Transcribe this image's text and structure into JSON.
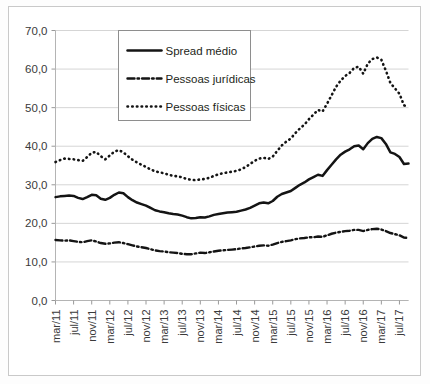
{
  "chart_data": {
    "type": "line",
    "title": "",
    "subtitle": "",
    "xlabel": "",
    "ylabel": "",
    "ylim": [
      0,
      70
    ],
    "ytick_labels": [
      "0,0",
      "10,0",
      "20,0",
      "30,0",
      "40,0",
      "50,0",
      "60,0",
      "70,0"
    ],
    "ytick_values": [
      0,
      10,
      20,
      30,
      40,
      50,
      60,
      70
    ],
    "grid": true,
    "legend_position": "top-center-left",
    "decimal_separator": ",",
    "x_tick_labels": [
      "mar/11",
      "jul/11",
      "nov/11",
      "mar/12",
      "jul/12",
      "nov/12",
      "mar/13",
      "jul/13",
      "nov/13",
      "mar/14",
      "jul/14",
      "nov/14",
      "mar/15",
      "jul/15",
      "nov/15",
      "mar/16",
      "jul/16",
      "nov/16",
      "mar/17",
      "jul/17"
    ],
    "x_tick_step_months": 4,
    "x_start": "mar/11",
    "x_end": "set/17",
    "x_months": [
      "mar/11",
      "abr/11",
      "mai/11",
      "jun/11",
      "jul/11",
      "ago/11",
      "set/11",
      "out/11",
      "nov/11",
      "dez/11",
      "jan/12",
      "fev/12",
      "mar/12",
      "abr/12",
      "mai/12",
      "jun/12",
      "jul/12",
      "ago/12",
      "set/12",
      "out/12",
      "nov/12",
      "dez/12",
      "jan/13",
      "fev/13",
      "mar/13",
      "abr/13",
      "mai/13",
      "jun/13",
      "jul/13",
      "ago/13",
      "set/13",
      "out/13",
      "nov/13",
      "dez/13",
      "jan/14",
      "fev/14",
      "mar/14",
      "abr/14",
      "mai/14",
      "jun/14",
      "jul/14",
      "ago/14",
      "set/14",
      "out/14",
      "nov/14",
      "dez/14",
      "jan/15",
      "fev/15",
      "mar/15",
      "abr/15",
      "mai/15",
      "jun/15",
      "jul/15",
      "ago/15",
      "set/15",
      "out/15",
      "nov/15",
      "dez/15",
      "jan/16",
      "fev/16",
      "mar/16",
      "abr/16",
      "mai/16",
      "jun/16",
      "jul/16",
      "ago/16",
      "set/16",
      "out/16",
      "nov/16",
      "dez/16",
      "jan/17",
      "fev/17",
      "mar/17",
      "abr/17",
      "mai/17",
      "jun/17",
      "jul/17",
      "ago/17",
      "set/17"
    ],
    "series": [
      {
        "name": "Spread médio",
        "style": "solid",
        "color": "#141414",
        "values": [
          26.8,
          27.0,
          27.1,
          27.2,
          27.1,
          26.6,
          26.3,
          26.8,
          27.4,
          27.3,
          26.4,
          26.1,
          26.6,
          27.4,
          28.0,
          27.8,
          26.8,
          26.0,
          25.4,
          25.0,
          24.6,
          24.0,
          23.4,
          23.1,
          22.9,
          22.6,
          22.4,
          22.3,
          22.0,
          21.6,
          21.3,
          21.4,
          21.6,
          21.5,
          21.8,
          22.2,
          22.4,
          22.6,
          22.8,
          22.9,
          23.0,
          23.3,
          23.6,
          24.0,
          24.6,
          25.2,
          25.4,
          25.2,
          25.8,
          26.9,
          27.6,
          28.0,
          28.4,
          29.2,
          30.0,
          30.6,
          31.4,
          32.0,
          32.6,
          32.3,
          33.8,
          35.2,
          36.6,
          37.8,
          38.6,
          39.2,
          40.0,
          40.2,
          39.2,
          40.8,
          41.9,
          42.4,
          42.1,
          40.6,
          38.4,
          38.0,
          37.2,
          35.4,
          35.5
        ]
      },
      {
        "name": "Pessoas jurídicas",
        "style": "dash-dot",
        "color": "#141414",
        "values": [
          15.7,
          15.6,
          15.5,
          15.6,
          15.4,
          15.2,
          15.1,
          15.4,
          15.6,
          15.3,
          14.9,
          14.7,
          14.8,
          15.0,
          15.1,
          14.9,
          14.6,
          14.3,
          14.0,
          13.8,
          13.6,
          13.3,
          13.0,
          12.8,
          12.7,
          12.5,
          12.4,
          12.3,
          12.1,
          12.0,
          12.0,
          12.2,
          12.4,
          12.3,
          12.5,
          12.7,
          12.9,
          13.0,
          13.1,
          13.2,
          13.3,
          13.5,
          13.6,
          13.8,
          14.0,
          14.2,
          14.3,
          14.2,
          14.5,
          14.9,
          15.2,
          15.4,
          15.6,
          15.9,
          16.1,
          16.2,
          16.4,
          16.4,
          16.6,
          16.5,
          16.9,
          17.3,
          17.6,
          17.8,
          18.0,
          18.1,
          18.3,
          18.3,
          18.0,
          18.3,
          18.5,
          18.6,
          18.4,
          18.0,
          17.5,
          17.2,
          16.9,
          16.3,
          16.2
        ]
      },
      {
        "name": "Pessoas físicas",
        "style": "dotted",
        "color": "#141414",
        "values": [
          35.9,
          36.4,
          36.8,
          36.7,
          36.6,
          36.4,
          36.2,
          37.2,
          38.3,
          38.5,
          37.4,
          36.6,
          37.6,
          38.6,
          39.0,
          38.4,
          37.4,
          36.5,
          35.8,
          35.2,
          34.6,
          34.0,
          33.5,
          33.2,
          33.0,
          32.6,
          32.3,
          32.2,
          31.9,
          31.5,
          31.3,
          31.2,
          31.4,
          31.5,
          31.8,
          32.3,
          32.7,
          33.0,
          33.2,
          33.4,
          33.6,
          34.0,
          34.6,
          35.4,
          36.2,
          36.8,
          37.0,
          36.7,
          37.3,
          38.8,
          40.2,
          41.2,
          42.0,
          43.4,
          44.6,
          45.6,
          47.0,
          48.2,
          49.4,
          49.0,
          51.0,
          53.2,
          55.4,
          57.0,
          58.2,
          59.0,
          60.3,
          60.6,
          58.8,
          61.4,
          62.6,
          63.0,
          62.4,
          59.6,
          56.4,
          55.0,
          53.6,
          50.6,
          50.2
        ]
      }
    ]
  },
  "legend": {
    "items": [
      {
        "label": "Spread médio",
        "marker": "solid-line"
      },
      {
        "label": "Pessoas jurídicas",
        "marker": "dash-dot-line"
      },
      {
        "label": "Pessoas físicas",
        "marker": "dotted-line"
      }
    ]
  }
}
